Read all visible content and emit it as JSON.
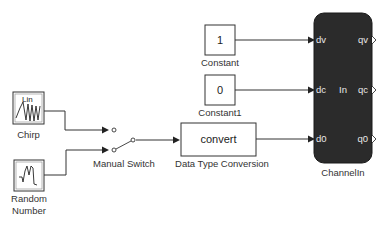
{
  "diagram": {
    "blocks": {
      "constant": {
        "name": "Constant",
        "value": "1"
      },
      "constant1": {
        "name": "Constant1",
        "value": "0"
      },
      "chirp": {
        "name": "Chirp",
        "icon_text": "Lin"
      },
      "random_number": {
        "name_line1": "Random",
        "name_line2": "Number"
      },
      "manual_switch": {
        "name": "Manual Switch"
      },
      "data_type_conversion": {
        "name": "Data Type Conversion",
        "text": "convert"
      },
      "channel_in": {
        "name": "ChannelIn",
        "center_text": "In",
        "inputs": [
          "dv",
          "dc",
          "d0"
        ],
        "outputs": [
          "qv",
          "qc",
          "q0"
        ],
        "color": "#2b2b2b"
      }
    }
  }
}
